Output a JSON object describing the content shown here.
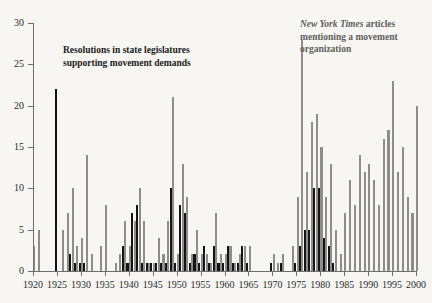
{
  "chart_data": {
    "type": "bar",
    "title": "",
    "subtitle": "",
    "xlabel": "",
    "ylabel": "",
    "xlim": [
      1919,
      2001
    ],
    "ylim": [
      0,
      30
    ],
    "yticks": [
      0,
      5,
      10,
      15,
      20,
      25,
      30
    ],
    "xticks": [
      1920,
      1925,
      1930,
      1935,
      1940,
      1945,
      1950,
      1955,
      1960,
      1965,
      1970,
      1975,
      1980,
      1985,
      1990,
      1995,
      2000
    ],
    "grid": false,
    "legend_position": "inline-annotations",
    "colors": {
      "resolutions": "#141414",
      "nyt_articles": "#8d8d8d",
      "background": "#f7f6f3",
      "axis": "#6e6e6e",
      "text": "#1a1a1a",
      "nyt_label_text": "#5e5e5e"
    },
    "annotations": [
      {
        "name": "resolutions-annotation",
        "text": "Resolutions in state legislatures supporting movement demands",
        "series": "resolutions"
      },
      {
        "name": "nyt-annotation",
        "title": "New York Times",
        "text": "articles mentioning a movement organization",
        "series": "nyt_articles"
      }
    ],
    "x": [
      1920,
      1921,
      1922,
      1923,
      1924,
      1925,
      1926,
      1927,
      1928,
      1929,
      1930,
      1931,
      1932,
      1933,
      1934,
      1935,
      1936,
      1937,
      1938,
      1939,
      1940,
      1941,
      1942,
      1943,
      1944,
      1945,
      1946,
      1947,
      1948,
      1949,
      1950,
      1951,
      1952,
      1953,
      1954,
      1955,
      1956,
      1957,
      1958,
      1959,
      1960,
      1961,
      1962,
      1963,
      1964,
      1965,
      1966,
      1967,
      1968,
      1969,
      1970,
      1971,
      1972,
      1973,
      1974,
      1975,
      1976,
      1977,
      1978,
      1979,
      1980,
      1981,
      1982,
      1983,
      1984,
      1985,
      1986,
      1987,
      1988,
      1989,
      1990,
      1991,
      1992,
      1993,
      1994,
      1995,
      1996,
      1997,
      1998,
      1999,
      2000
    ],
    "series": [
      {
        "name": "New York Times articles mentioning a movement organization",
        "short_name": "nyt_articles",
        "color": "#8d8d8d",
        "values": [
          3,
          5,
          0,
          0,
          0,
          0,
          5,
          7,
          10,
          3,
          4,
          14,
          2,
          0,
          3,
          8,
          0,
          1,
          2,
          6,
          3,
          6,
          10,
          6,
          1,
          1,
          4,
          2,
          6,
          21,
          2,
          13,
          9,
          2,
          5,
          2,
          2,
          1,
          7,
          2,
          2,
          3,
          1,
          2,
          3,
          3,
          0,
          0,
          0,
          0,
          2,
          1,
          2,
          0,
          3,
          9,
          28,
          12,
          18,
          19,
          15,
          9,
          13,
          5,
          2,
          7,
          11,
          8,
          14,
          12,
          13,
          11,
          8,
          16,
          17,
          23,
          12,
          15,
          9,
          7,
          20
        ]
      },
      {
        "name": "Resolutions in state legislatures supporting movement demands",
        "short_name": "resolutions",
        "color": "#141414",
        "values": [
          0,
          0,
          0,
          0,
          0,
          22,
          0,
          0,
          2,
          1,
          1,
          1,
          0,
          0,
          0,
          0,
          0,
          0,
          0,
          3,
          1,
          7,
          8,
          1,
          1,
          1,
          1,
          1,
          1,
          10,
          1,
          8,
          7,
          1,
          2,
          1,
          3,
          1,
          3,
          1,
          1,
          3,
          1,
          1,
          3,
          1,
          0,
          0,
          0,
          0,
          1,
          0,
          1,
          0,
          0,
          1,
          3,
          5,
          5,
          10,
          10,
          4,
          3,
          1,
          0,
          0,
          0,
          0,
          0,
          0,
          0,
          0,
          0,
          0,
          0,
          0,
          0,
          0,
          0,
          0,
          0
        ]
      }
    ]
  }
}
